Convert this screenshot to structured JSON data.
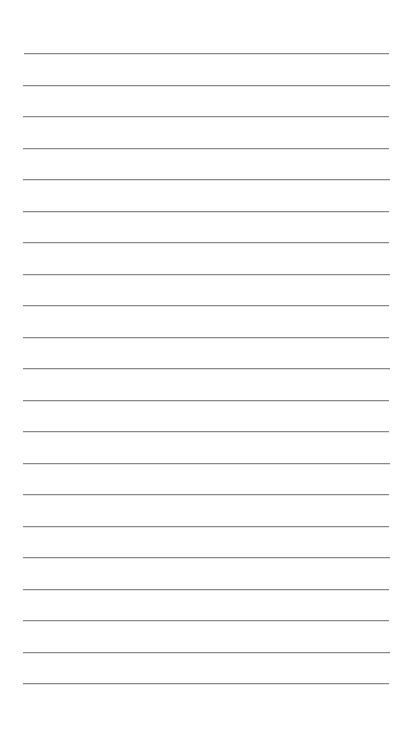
{
  "document": {
    "kind": "lined-paper",
    "title": "Lined Paper",
    "page_width": 409,
    "page_height": 735,
    "background_color": "#ffffff",
    "orientation": "portrait"
  },
  "ruling": {
    "line_color": "#8a8a8a",
    "line_thickness": 1,
    "line_count": 21,
    "first_line_y": 53,
    "line_spacing": 31.5,
    "left_margin": 23,
    "right_margin": 20,
    "line_left_x": 23,
    "line_right_x": 389,
    "line_length": 366,
    "top_blank_space": 53,
    "bottom_blank_space": 52,
    "has_vertical_margin_rule": false,
    "has_header_rule": false
  },
  "lines": [
    {
      "index": 1,
      "y": 53.0,
      "x1": 24,
      "x2": 389,
      "faint": false
    },
    {
      "index": 2,
      "y": 84.5,
      "x1": 23,
      "x2": 390,
      "faint": false
    },
    {
      "index": 3,
      "y": 116.0,
      "x1": 23,
      "x2": 389,
      "faint": false
    },
    {
      "index": 4,
      "y": 147.5,
      "x1": 23,
      "x2": 389,
      "faint": false
    },
    {
      "index": 5,
      "y": 179.0,
      "x1": 23,
      "x2": 390,
      "faint": false
    },
    {
      "index": 6,
      "y": 210.5,
      "x1": 23,
      "x2": 389,
      "faint": false
    },
    {
      "index": 7,
      "y": 242.0,
      "x1": 23,
      "x2": 389,
      "faint": false
    },
    {
      "index": 8,
      "y": 273.5,
      "x1": 23,
      "x2": 390,
      "faint": false
    },
    {
      "index": 9,
      "y": 305.0,
      "x1": 23,
      "x2": 389,
      "faint": false
    },
    {
      "index": 10,
      "y": 336.5,
      "x1": 23,
      "x2": 389,
      "faint": false
    },
    {
      "index": 11,
      "y": 368.0,
      "x1": 23,
      "x2": 390,
      "faint": false
    },
    {
      "index": 12,
      "y": 399.5,
      "x1": 23,
      "x2": 389,
      "faint": false
    },
    {
      "index": 13,
      "y": 431.0,
      "x1": 23,
      "x2": 389,
      "faint": false
    },
    {
      "index": 14,
      "y": 462.5,
      "x1": 23,
      "x2": 390,
      "faint": false
    },
    {
      "index": 15,
      "y": 494.0,
      "x1": 23,
      "x2": 389,
      "faint": false
    },
    {
      "index": 16,
      "y": 525.5,
      "x1": 23,
      "x2": 389,
      "faint": false
    },
    {
      "index": 17,
      "y": 557.0,
      "x1": 23,
      "x2": 390,
      "faint": false
    },
    {
      "index": 18,
      "y": 588.5,
      "x1": 23,
      "x2": 389,
      "faint": false
    },
    {
      "index": 19,
      "y": 620.0,
      "x1": 23,
      "x2": 389,
      "faint": false
    },
    {
      "index": 20,
      "y": 651.5,
      "x1": 23,
      "x2": 390,
      "faint": false
    },
    {
      "index": 21,
      "y": 683.0,
      "x1": 23,
      "x2": 389,
      "faint": false
    }
  ],
  "content": {
    "written_text": "",
    "is_blank": true
  }
}
